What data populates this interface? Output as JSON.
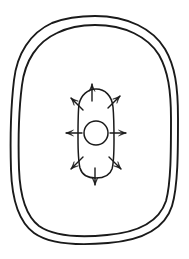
{
  "figure": {
    "background_color": "#ffffff",
    "ink_color": "#1a1a1a",
    "canvas": {
      "width": 189,
      "height": 259
    }
  },
  "shapes": {
    "outer_boundary": {
      "name": "outer-boundary",
      "style": "double-contour rounded rectangle",
      "line_count": 2,
      "stroke_color": "#1a1a1a",
      "stroke_width": 1.9,
      "outer_path": "M 95 16 C 128 16 153 29 165 49 C 175 66 178 86 178 118 C 178 152 178 186 172 206 C 166 225 147 240 108 243 C 74 246 48 243 34 233 C 19 222 12 201 11 170 C 10 137 11 105 14 80 C 17 54 30 33 52 23 C 65 18 80 16 95 16 Z",
      "inner_path": "M 95 25 C 125 25 148 37 159 55 C 168 71 171 90 171 119 C 171 151 171 183 166 201 C 160 219 143 232 107 235 C 76 238 52 235 39 226 C 26 216 20 197 19 169 C 18 138 19 108 22 85 C 25 61 37 42 57 33 C 69 27 82 25 95 25 Z"
    },
    "inner_capsule": {
      "name": "inner-capsule",
      "style": "vertical capsule / stadium outline",
      "stroke_color": "#1a1a1a",
      "stroke_width": 1.5,
      "bounds": {
        "x": 76,
        "y": 88,
        "width": 41,
        "height": 90
      },
      "path": "M 96 89 C 105 89 112 96 113 107 C 114 118 114 130 114 140 C 114 151 114 162 112 169 C 110 175 104 178 96 178 C 88 178 82 175 80 168 C 78 160 78 148 78 137 C 78 125 78 112 79 104 C 81 95 88 89 96 89 Z"
    },
    "nucleus": {
      "name": "nucleus-circle",
      "style": "circle outline",
      "stroke_color": "#1a1a1a",
      "stroke_width": 1.5,
      "center": {
        "x": 96,
        "y": 133
      },
      "radius": 12
    }
  },
  "arrows": {
    "name": "radiating-arrows",
    "count": 8,
    "stroke_color": "#1a1a1a",
    "stroke_width": 1.4,
    "direction": "outward",
    "items": [
      {
        "label": "arrow-top",
        "angle_deg": 270,
        "tail": {
          "x": 92,
          "y": 101
        },
        "tip": {
          "x": 92,
          "y": 84
        }
      },
      {
        "label": "arrow-top-right",
        "angle_deg": 315,
        "tail": {
          "x": 108,
          "y": 108
        },
        "tip": {
          "x": 120,
          "y": 96
        }
      },
      {
        "label": "arrow-right",
        "angle_deg": 0,
        "tail": {
          "x": 110,
          "y": 133
        },
        "tip": {
          "x": 126,
          "y": 133
        }
      },
      {
        "label": "arrow-bottom-right",
        "angle_deg": 45,
        "tail": {
          "x": 109,
          "y": 157
        },
        "tip": {
          "x": 121,
          "y": 169
        }
      },
      {
        "label": "arrow-bottom",
        "angle_deg": 90,
        "tail": {
          "x": 95,
          "y": 168
        },
        "tip": {
          "x": 95,
          "y": 185
        }
      },
      {
        "label": "arrow-bottom-left",
        "angle_deg": 135,
        "tail": {
          "x": 83,
          "y": 157
        },
        "tip": {
          "x": 71,
          "y": 169
        }
      },
      {
        "label": "arrow-left",
        "angle_deg": 180,
        "tail": {
          "x": 82,
          "y": 133
        },
        "tip": {
          "x": 66,
          "y": 133
        }
      },
      {
        "label": "arrow-top-left",
        "angle_deg": 225,
        "tail": {
          "x": 83,
          "y": 110
        },
        "tip": {
          "x": 71,
          "y": 98
        }
      }
    ]
  }
}
